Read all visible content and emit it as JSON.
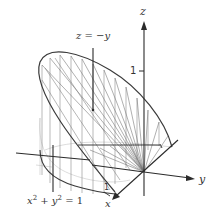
{
  "figure": {
    "type": "3d-surface-diagram",
    "axes": {
      "x_label": "x",
      "y_label": "y",
      "z_label": "z"
    },
    "ticks": {
      "z_tick": "1",
      "x_tick": "1",
      "y_tick": "1"
    },
    "annotations": {
      "plane_label": "z = −y",
      "cylinder_label_base": "x",
      "cylinder_label_plus": " + y",
      "cylinder_label_eq": " = 1",
      "superscript": "2"
    },
    "colors": {
      "axis": "#2b2b2b",
      "surface_lines": "#7a7a7a",
      "faint_lines": "#bdbdbd",
      "edge": "#3a3a3a"
    }
  }
}
